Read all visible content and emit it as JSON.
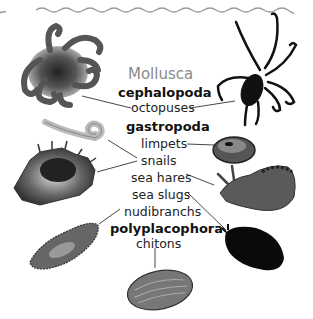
{
  "diagram": {
    "title": "Mollusca",
    "groups": [
      {
        "name": "cephalopoda",
        "members": [
          "octopuses"
        ]
      },
      {
        "name": "gastropoda",
        "members": [
          "limpets",
          "snails",
          "sea hares",
          "sea slugs",
          "nudibranchs"
        ]
      },
      {
        "name": "polyplacophora",
        "members": [
          "chitons"
        ]
      }
    ],
    "illustrations": [
      {
        "name": "octopus-left",
        "links_to": "octopuses"
      },
      {
        "name": "octopus-right",
        "links_to": "octopuses"
      },
      {
        "name": "worm-snail",
        "links_to": "snails"
      },
      {
        "name": "murex-snail",
        "links_to": "snails"
      },
      {
        "name": "limpet",
        "links_to": "limpets"
      },
      {
        "name": "sea-hare",
        "links_to": "sea hares"
      },
      {
        "name": "sea-slug",
        "links_to": "sea slugs"
      },
      {
        "name": "nudibranch",
        "links_to": "nudibranchs"
      },
      {
        "name": "chiton",
        "links_to": "chitons"
      }
    ],
    "colors": {
      "title": "#8a8a8a",
      "wave": "#9a9a9a",
      "text": "#222222",
      "lines": "#333333"
    }
  }
}
